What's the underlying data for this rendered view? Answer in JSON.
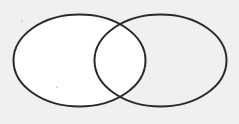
{
  "figure": {
    "width": 239,
    "height": 124,
    "background_color": "#f1f0ef",
    "stroke_color": "#2a2a2a",
    "fill_color": "#ffffff",
    "stroke_width": 2,
    "shape_count": 2,
    "labels": []
  },
  "shapes": [
    {
      "name": "left-ellipse",
      "role": "set-a",
      "cx": 79.5,
      "cy": 60.5,
      "rx": 66,
      "ry": 46,
      "fill": "#ffffff",
      "stroke": "#2a2a2a",
      "stroke_width": 2,
      "label": ""
    },
    {
      "name": "right-ellipse",
      "role": "set-b",
      "cx": 160.5,
      "cy": 60.5,
      "rx": 66,
      "ry": 46,
      "fill": "#ffffff",
      "stroke": "#2a2a2a",
      "stroke_width": 2,
      "label": ""
    }
  ],
  "intersection": {
    "name": "overlap-region",
    "label": "",
    "top_point": {
      "x": 120,
      "y": 25
    },
    "bottom_point": {
      "x": 120,
      "y": 96
    },
    "left_bound": 94,
    "right_bound": 146,
    "fill": "#ffffff"
  },
  "artifacts": [
    {
      "name": "scan-speck-top-left",
      "x": 21,
      "y": 20,
      "size": 2,
      "color": "rgba(150,150,150,0.45)"
    },
    {
      "name": "scan-speck-lower-left",
      "x": 56,
      "y": 86,
      "size": 2,
      "color": "rgba(150,150,150,0.45)"
    }
  ]
}
